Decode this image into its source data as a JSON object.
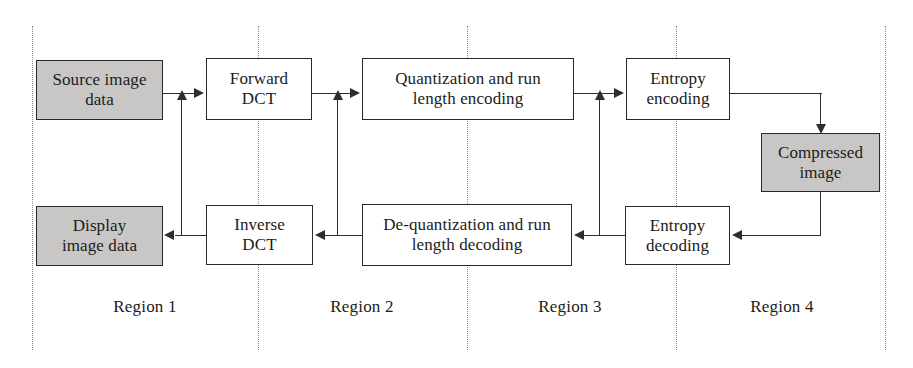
{
  "diagram": {
    "title_hidden": "",
    "colors": {
      "shaded_fill": "#c9c7c5",
      "box_border": "#2a2a2a",
      "connector": "#2e2e2e",
      "divider": "#8d8d8d",
      "background": "#ffffff"
    },
    "nodes": [
      {
        "id": "source-image-data",
        "label": "Source image data",
        "style": "shaded",
        "row": "top"
      },
      {
        "id": "forward-dct",
        "label": "Forward DCT",
        "style": "plain",
        "row": "top"
      },
      {
        "id": "quantization-encoding",
        "label": "Quantization and run length encoding",
        "style": "plain",
        "row": "top"
      },
      {
        "id": "entropy-encoding",
        "label": "Entropy encoding",
        "style": "plain",
        "row": "top"
      },
      {
        "id": "compressed-image",
        "label": "Compressed image",
        "style": "shaded",
        "row": "middle"
      },
      {
        "id": "display-image-data",
        "label": "Display image data",
        "style": "shaded",
        "row": "bottom"
      },
      {
        "id": "inverse-dct",
        "label": "Inverse DCT",
        "style": "plain",
        "row": "bottom"
      },
      {
        "id": "dequantization-decoding",
        "label": "De-quantization and run length decoding",
        "style": "plain",
        "row": "bottom"
      },
      {
        "id": "entropy-decoding",
        "label": "Entropy decoding",
        "style": "plain",
        "row": "bottom"
      }
    ],
    "node_labels": {
      "source_image_data_line1": "Source image",
      "source_image_data_line2": "data",
      "forward_dct_line1": "Forward",
      "forward_dct_line2": "DCT",
      "quantization_line1": "Quantization and run",
      "quantization_line2": "length encoding",
      "entropy_encoding_line1": "Entropy",
      "entropy_encoding_line2": "encoding",
      "compressed_image_line1": "Compressed",
      "compressed_image_line2": "image",
      "display_image_data_line1": "Display",
      "display_image_data_line2": "image data",
      "inverse_dct_line1": "Inverse",
      "inverse_dct_line2": "DCT",
      "dequantization_line1": "De-quantization and run",
      "dequantization_line2": "length decoding",
      "entropy_decoding_line1": "Entropy",
      "entropy_decoding_line2": "decoding"
    },
    "regions": [
      {
        "id": "region-1",
        "label": "Region 1"
      },
      {
        "id": "region-2",
        "label": "Region 2"
      },
      {
        "id": "region-3",
        "label": "Region 3"
      },
      {
        "id": "region-4",
        "label": "Region 4"
      }
    ],
    "edges": [
      {
        "from": "source-image-data",
        "to": "forward-dct",
        "direction": "right"
      },
      {
        "from": "forward-dct",
        "to": "quantization-encoding",
        "direction": "right"
      },
      {
        "from": "quantization-encoding",
        "to": "entropy-encoding",
        "direction": "right"
      },
      {
        "from": "entropy-encoding",
        "to": "compressed-image",
        "direction": "down"
      },
      {
        "from": "compressed-image",
        "to": "entropy-decoding",
        "direction": "left"
      },
      {
        "from": "entropy-decoding",
        "to": "dequantization-decoding",
        "direction": "left"
      },
      {
        "from": "dequantization-decoding",
        "to": "inverse-dct",
        "direction": "left"
      },
      {
        "from": "inverse-dct",
        "to": "display-image-data",
        "direction": "left"
      },
      {
        "from": "inverse-dct-feedback",
        "to": "forward-dct",
        "direction": "up"
      },
      {
        "from": "dequantization-feedback",
        "to": "quantization-encoding",
        "direction": "up"
      },
      {
        "from": "entropy-decoding-feedback",
        "to": "entropy-encoding",
        "direction": "up"
      }
    ]
  }
}
